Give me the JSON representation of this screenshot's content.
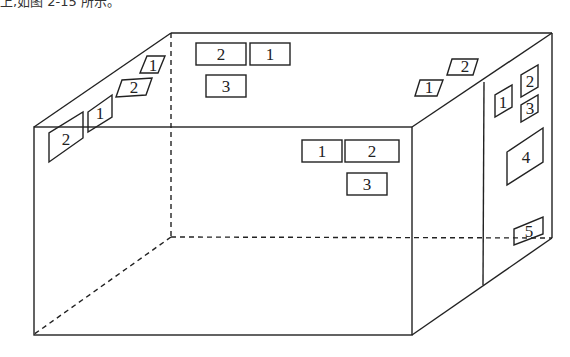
{
  "caption": "上,如图 2-15 所示。",
  "colors": {
    "line": "#222222",
    "background": "#ffffff"
  },
  "figure": {
    "type": "3d-box-room",
    "box": {
      "front_top_left": [
        34,
        127
      ],
      "front_top_right": [
        412,
        127
      ],
      "front_bottom_left": [
        33,
        335
      ],
      "front_bottom_right": [
        412,
        335
      ],
      "back_top_left": [
        171,
        33
      ],
      "back_top_right": [
        552,
        33
      ],
      "back_bottom_left": [
        171,
        237
      ],
      "back_bottom_right": [
        552,
        238
      ],
      "partition_top": [
        484,
        82
      ],
      "partition_bottom": [
        483,
        285
      ]
    },
    "groups": [
      {
        "name": "left-wall-group",
        "labels": [
          {
            "text": "1",
            "face": "top-left"
          },
          {
            "text": "2",
            "face": "top-left"
          },
          {
            "text": "1",
            "face": "left"
          },
          {
            "text": "2",
            "face": "left"
          }
        ]
      },
      {
        "name": "back-wall-top-group",
        "labels": [
          {
            "text": "2"
          },
          {
            "text": "1"
          },
          {
            "text": "3"
          }
        ]
      },
      {
        "name": "top-right-group",
        "labels": [
          {
            "text": "2"
          },
          {
            "text": "1"
          }
        ]
      },
      {
        "name": "front-wall-group",
        "labels": [
          {
            "text": "1"
          },
          {
            "text": "2"
          },
          {
            "text": "3"
          }
        ]
      },
      {
        "name": "right-wall-group",
        "labels": [
          {
            "text": "1"
          },
          {
            "text": "2"
          },
          {
            "text": "3"
          },
          {
            "text": "4"
          },
          {
            "text": "5"
          }
        ]
      }
    ]
  }
}
